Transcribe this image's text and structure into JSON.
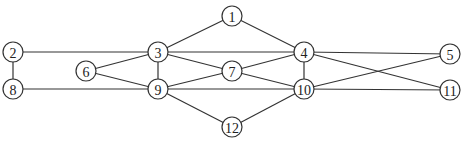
{
  "diagram": {
    "type": "undirected-graph",
    "node_radius": 10,
    "nodes": [
      {
        "id": "1",
        "label": "1",
        "x": 232,
        "y": 16
      },
      {
        "id": "2",
        "label": "2",
        "x": 13,
        "y": 52
      },
      {
        "id": "3",
        "label": "3",
        "x": 158,
        "y": 52
      },
      {
        "id": "4",
        "label": "4",
        "x": 304,
        "y": 52
      },
      {
        "id": "5",
        "label": "5",
        "x": 450,
        "y": 54
      },
      {
        "id": "6",
        "label": "6",
        "x": 86,
        "y": 71
      },
      {
        "id": "7",
        "label": "7",
        "x": 232,
        "y": 71
      },
      {
        "id": "8",
        "label": "8",
        "x": 13,
        "y": 89
      },
      {
        "id": "9",
        "label": "9",
        "x": 158,
        "y": 89
      },
      {
        "id": "10",
        "label": "10",
        "x": 304,
        "y": 89
      },
      {
        "id": "11",
        "label": "11",
        "x": 450,
        "y": 90
      },
      {
        "id": "12",
        "label": "12",
        "x": 232,
        "y": 127
      }
    ],
    "edges": [
      [
        "1",
        "3"
      ],
      [
        "1",
        "4"
      ],
      [
        "2",
        "3"
      ],
      [
        "3",
        "4"
      ],
      [
        "4",
        "5"
      ],
      [
        "2",
        "8"
      ],
      [
        "8",
        "9"
      ],
      [
        "9",
        "10"
      ],
      [
        "10",
        "11"
      ],
      [
        "3",
        "6"
      ],
      [
        "6",
        "9"
      ],
      [
        "3",
        "9"
      ],
      [
        "3",
        "7"
      ],
      [
        "7",
        "9"
      ],
      [
        "7",
        "4"
      ],
      [
        "7",
        "10"
      ],
      [
        "4",
        "10"
      ],
      [
        "4",
        "11"
      ],
      [
        "5",
        "10"
      ],
      [
        "9",
        "12"
      ],
      [
        "12",
        "10"
      ]
    ]
  }
}
